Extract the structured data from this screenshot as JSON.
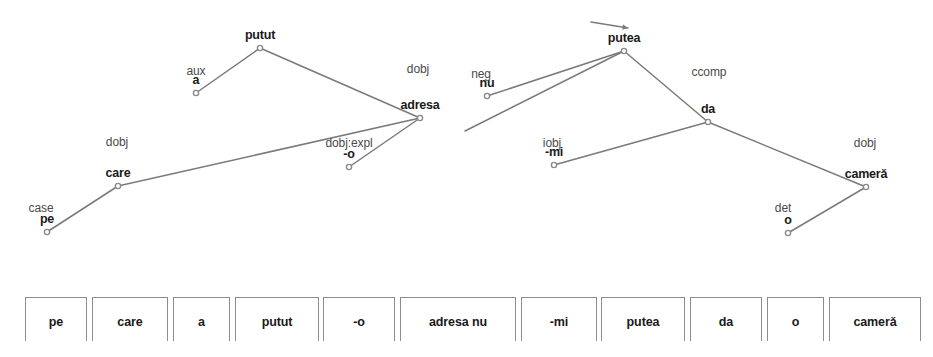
{
  "figure": {
    "kind": "dependency-parse-tree",
    "sentence": "pe care a putut -o adresa nu -mi putea da o cameră",
    "edge_color": "#7a7a7a",
    "node_color": "#8a8a8a",
    "text_color": "#1a1a1a",
    "label_color": "#4a4a4a",
    "background": "#ffffff"
  },
  "nodes": [
    {
      "id": "putut",
      "label": "putut",
      "x": 260,
      "y": 48,
      "label_dy": -6
    },
    {
      "id": "a",
      "label": "a",
      "x": 196,
      "y": 93,
      "label_dy": -6
    },
    {
      "id": "adresa",
      "label": "adresa",
      "x": 420,
      "y": 118,
      "label_dy": -6
    },
    {
      "id": "care",
      "label": "care",
      "x": 118,
      "y": 186,
      "label_dy": -6
    },
    {
      "id": "pe",
      "label": "pe",
      "x": 47,
      "y": 232,
      "label_dy": -6
    },
    {
      "id": "minuso",
      "label": "-o",
      "x": 349,
      "y": 167,
      "label_dy": -6
    },
    {
      "id": "putea",
      "label": "putea",
      "x": 624,
      "y": 51,
      "label_dy": -6
    },
    {
      "id": "nu",
      "label": "nu",
      "x": 487,
      "y": 96,
      "label_dy": -6
    },
    {
      "id": "da",
      "label": "da",
      "x": 708,
      "y": 122,
      "label_dy": -6
    },
    {
      "id": "mi",
      "label": "-mi",
      "x": 554,
      "y": 165,
      "label_dy": -6
    },
    {
      "id": "camera",
      "label": "camerǎ",
      "x": 866,
      "y": 187,
      "label_dy": -6
    },
    {
      "id": "o",
      "label": "o",
      "x": 788,
      "y": 233,
      "label_dy": -6
    }
  ],
  "edges": [
    {
      "id": "e-aux",
      "label": "aux",
      "from": "putut",
      "to": "a",
      "label_x": 196,
      "label_y": 78
    },
    {
      "id": "e-dobj-1",
      "label": "dobj",
      "from": "putut",
      "to": "adresa",
      "label_x": 418,
      "label_y": 76
    },
    {
      "id": "e-dobj-2",
      "label": "dobj",
      "from": "adresa",
      "to": "care",
      "label_x": 117,
      "label_y": 149
    },
    {
      "id": "e-dobjexpl",
      "label": "dobj:expl",
      "from": "adresa",
      "to": "minuso",
      "label_x": 349,
      "label_y": 150
    },
    {
      "id": "e-case",
      "label": "case",
      "from": "care",
      "to": "pe",
      "label_x": 41,
      "label_y": 215
    },
    {
      "id": "e-neg",
      "label": "neg",
      "from": "putea",
      "to": "nu",
      "label_x": 481,
      "label_y": 81
    },
    {
      "id": "e-ccomp",
      "label": "ccomp",
      "from": "putea",
      "to": "da",
      "label_x": 709,
      "label_y": 79
    },
    {
      "id": "e-iobj",
      "label": "iobj",
      "from": "da",
      "to": "mi",
      "label_x": 552,
      "label_y": 150
    },
    {
      "id": "e-dobj-3",
      "label": "dobj",
      "from": "da",
      "to": "camera",
      "label_x": 865,
      "label_y": 150
    },
    {
      "id": "e-det",
      "label": "det",
      "from": "camera",
      "to": "o",
      "label_x": 783,
      "label_y": 215
    }
  ],
  "cross_edges": [
    {
      "id": "x-adresa-putea",
      "from": "putea",
      "to_x": 465,
      "to_y": 131,
      "note": "long edge from putea crossing to adresa region"
    },
    {
      "id": "x-root-arc",
      "from_x": 591,
      "from_y": 22,
      "to_x": 628,
      "to_y": 28,
      "note": "incoming root arrow above putea"
    }
  ],
  "wordbar": {
    "boxes": [
      {
        "id": "wb-pe",
        "text": "pe",
        "x": 25,
        "w": 62
      },
      {
        "id": "wb-care",
        "text": "care",
        "x": 92,
        "w": 76
      },
      {
        "id": "wb-a",
        "text": "a",
        "x": 173,
        "w": 57
      },
      {
        "id": "wb-putut",
        "text": "putut",
        "x": 235,
        "w": 84
      },
      {
        "id": "wb-o",
        "text": "-o",
        "x": 323,
        "w": 72
      },
      {
        "id": "wb-adresa",
        "text": "adresa nu",
        "x": 400,
        "w": 116
      },
      {
        "id": "wb-mi",
        "text": "-mi",
        "x": 521,
        "w": 76
      },
      {
        "id": "wb-putea",
        "text": "putea",
        "x": 601,
        "w": 84
      },
      {
        "id": "wb-da",
        "text": "da",
        "x": 690,
        "w": 72
      },
      {
        "id": "wb-o2",
        "text": "o",
        "x": 767,
        "w": 57
      },
      {
        "id": "wb-camera",
        "text": "camerǎ",
        "x": 829,
        "w": 92
      }
    ]
  }
}
